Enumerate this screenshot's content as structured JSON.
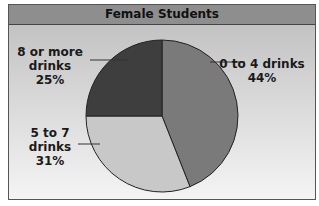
{
  "chart_data": {
    "type": "pie",
    "title": "Female Students",
    "slices": [
      {
        "label_lines": [
          "0 to 4 drinks"
        ],
        "value": 44,
        "value_label": "44%",
        "color": "#7a7a7a"
      },
      {
        "label_lines": [
          "5 to 7",
          "drinks"
        ],
        "value": 31,
        "value_label": "31%",
        "color": "#c8c8c8"
      },
      {
        "label_lines": [
          "8 or more",
          "drinks"
        ],
        "value": 25,
        "value_label": "25%",
        "color": "#3e3e3e"
      }
    ],
    "start_angle": "12 o'clock",
    "direction": "clockwise",
    "legend": "none (direct labels with leader lines)"
  }
}
